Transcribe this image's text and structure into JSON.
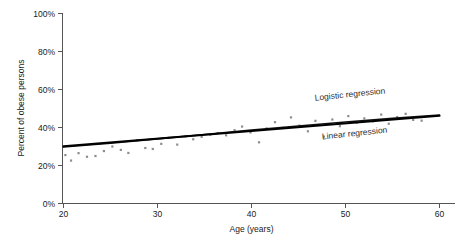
{
  "chart_data": {
    "type": "scatter",
    "title": "",
    "xlabel": "Age (years)",
    "ylabel": "Percent of obese persons",
    "xlim": [
      20,
      60
    ],
    "ylim": [
      0,
      100
    ],
    "xticks": [
      20,
      30,
      40,
      50,
      60
    ],
    "xtick_labels": [
      "20",
      "30",
      "40",
      "50",
      "60"
    ],
    "yticks": [
      0,
      20,
      40,
      60,
      80,
      100
    ],
    "ytick_labels": [
      "0%",
      "20%",
      "40%",
      "60%",
      "80%",
      "100%"
    ],
    "grid": false,
    "legend_position": "inline-annotations",
    "point_color": "#8d8d8d",
    "line_color": "#000000",
    "series": [
      {
        "name": "Observed data",
        "type": "scatter",
        "x": [
          20.2,
          20.8,
          21.6,
          22.5,
          23.4,
          24.3,
          25.2,
          26.1,
          26.9,
          27.8,
          28.7,
          29.5,
          30.4,
          31.2,
          32.1,
          33.0,
          33.8,
          34.7,
          35.6,
          36.4,
          37.3,
          38.2,
          39.0,
          39.9,
          40.8,
          41.6,
          42.5,
          43.4,
          44.2,
          45.1,
          46.0,
          46.8,
          47.7,
          48.6,
          49.4,
          50.3,
          51.2,
          52.0,
          52.9,
          53.8,
          54.6,
          55.5,
          56.4,
          57.2,
          58.1
        ],
        "y": [
          25.5,
          22.6,
          26.5,
          24.6,
          25.0,
          27.6,
          30.0,
          28.2,
          26.6,
          33.3,
          29.2,
          28.7,
          31.4,
          34.6,
          31.0,
          35.3,
          33.8,
          35.1,
          36.2,
          37.0,
          35.9,
          38.6,
          40.5,
          37.4,
          32.2,
          39.5,
          42.8,
          39.8,
          45.3,
          41.0,
          38.0,
          43.5,
          35.2,
          44.2,
          40.7,
          46.0,
          42.5,
          44.8,
          43.2,
          46.8,
          42.0,
          45.5,
          47.2,
          44.0,
          43.6
        ]
      },
      {
        "name": "Linear regression",
        "type": "line",
        "x": [
          20,
          60
        ],
        "y": [
          30.1,
          46.2
        ]
      },
      {
        "name": "Logistic regression",
        "type": "line",
        "x": [
          20,
          25,
          30,
          35,
          40,
          45,
          50,
          55,
          60
        ],
        "y": [
          29.7,
          31.8,
          34.0,
          36.3,
          38.6,
          40.8,
          42.9,
          44.8,
          46.5
        ]
      }
    ],
    "annotations": [
      {
        "id": "logistic-label",
        "text": "Logistic regression",
        "x": 50.5,
        "y": 56.0,
        "rotation": -6
      },
      {
        "id": "linear-label",
        "text": "Linear regression",
        "x": 51.0,
        "y": 35.5,
        "rotation": -6
      }
    ]
  }
}
